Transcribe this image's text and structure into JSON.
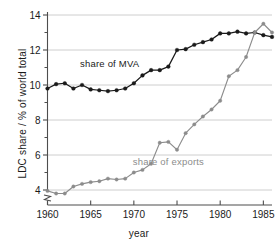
{
  "chart_data": {
    "type": "line",
    "title": "",
    "xlabel": "year",
    "ylabel": "LDC share / % of world total",
    "xlim": [
      1960,
      1986
    ],
    "ylim": [
      3.6,
      14
    ],
    "xticks": [
      1960,
      1965,
      1970,
      1975,
      1980,
      1985
    ],
    "yticks": [
      4,
      6,
      8,
      10,
      12,
      14
    ],
    "grid": "horizontal",
    "axis_break": "y-axis break below 4",
    "legend_position": "inline-annotations",
    "x": [
      1960,
      1961,
      1962,
      1963,
      1964,
      1965,
      1966,
      1967,
      1968,
      1969,
      1970,
      1971,
      1972,
      1973,
      1974,
      1975,
      1976,
      1977,
      1978,
      1979,
      1980,
      1981,
      1982,
      1983,
      1984,
      1985,
      1986
    ],
    "series": [
      {
        "name": "share of MVA",
        "color": "#1a1a1a",
        "marker": "filled-circle",
        "label_x": 1967.2,
        "label_y": 11.05,
        "values": [
          9.8,
          10.05,
          10.1,
          9.8,
          10.0,
          9.75,
          9.7,
          9.65,
          9.7,
          9.8,
          10.1,
          10.55,
          10.85,
          10.85,
          11.05,
          12.0,
          12.05,
          12.3,
          12.45,
          12.6,
          12.95,
          12.95,
          13.05,
          12.95,
          13.0,
          12.85,
          12.75
        ]
      },
      {
        "name": "share of exports",
        "color": "#8c8c8c",
        "marker": "filled-circle",
        "label_x": 1974.0,
        "label_y": 5.45,
        "values": [
          3.95,
          3.8,
          3.8,
          4.2,
          4.35,
          4.45,
          4.5,
          4.65,
          4.6,
          4.65,
          5.0,
          5.15,
          5.5,
          6.7,
          6.75,
          6.3,
          7.25,
          7.75,
          8.2,
          8.6,
          9.1,
          10.5,
          10.85,
          11.6,
          13.0,
          13.5,
          13.0
        ]
      }
    ]
  },
  "axes": {
    "y_tick_labels": [
      "4",
      "6",
      "8",
      "10",
      "12",
      "14"
    ],
    "x_tick_labels": [
      "1960",
      "1965",
      "1970",
      "1975",
      "1980",
      "1985"
    ],
    "x_axis_title": "year",
    "y_axis_title": "LDC share / % of world total"
  },
  "annotations": {
    "mva_label": "share of MVA",
    "exports_label": "share of exports"
  },
  "colors": {
    "mva": "#1a1a1a",
    "exports": "#8c8c8c",
    "grid": "#c8c8c8",
    "axis": "#4d4d4d",
    "background": "#ffffff"
  }
}
